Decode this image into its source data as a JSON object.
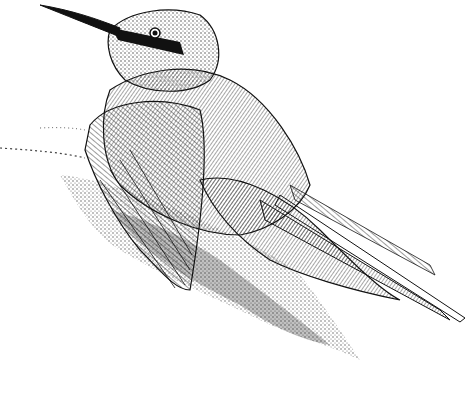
{
  "image": {
    "subject": "bee-eater bird",
    "style": "black-and-white pen-and-ink illustration",
    "description": "A bee-eater with a long curved beak and dark eye stripe, resting with wings spread on a stippled mound",
    "colors": {
      "ink": "#111111",
      "paper": "#ffffff",
      "stipple": "#333333"
    }
  }
}
